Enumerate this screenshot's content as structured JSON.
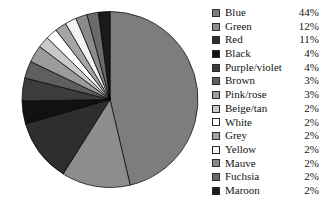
{
  "chart_data": {
    "type": "pie",
    "title": "",
    "start_angle_deg": 0,
    "direction": "clockwise",
    "legend_position": "right",
    "grid": false,
    "units": "percent",
    "categories": [
      "Blue",
      "Green",
      "Red",
      "Black",
      "Purple/violet",
      "Brown",
      "Pink/rose",
      "Beige/tan",
      "White",
      "Grey",
      "Yellow",
      "Mauve",
      "Fuchsia",
      "Maroon"
    ],
    "values": [
      44,
      12,
      11,
      4,
      4,
      3,
      3,
      2,
      2,
      2,
      2,
      2,
      2,
      2
    ],
    "labels": [
      "44%",
      "12%",
      "11%",
      "4%",
      "4%",
      "3%",
      "3%",
      "2%",
      "2%",
      "2%",
      "2%",
      "2%",
      "2%",
      "2%"
    ],
    "slice_colors": [
      "#7d7d7d",
      "#8d8d8d",
      "#2e2e2e",
      "#111111",
      "#3c3c3c",
      "#5f5f5f",
      "#9b9b9b",
      "#c9c9c9",
      "#ffffff",
      "#a5a5a5",
      "#f2f2f2",
      "#8a8a8a",
      "#6a6a6a",
      "#1a1a1a"
    ],
    "xlabel": "",
    "ylabel": ""
  },
  "legend": {
    "items": [
      {
        "label": "Blue",
        "pct": "44%",
        "swatch": "#7d7d7d"
      },
      {
        "label": "Green",
        "pct": "12%",
        "swatch": "#8d8d8d"
      },
      {
        "label": "Red",
        "pct": "11%",
        "swatch": "#2e2e2e"
      },
      {
        "label": "Black",
        "pct": "4%",
        "swatch": "#111111"
      },
      {
        "label": "Purple/violet",
        "pct": "4%",
        "swatch": "#3c3c3c"
      },
      {
        "label": "Brown",
        "pct": "3%",
        "swatch": "#5f5f5f"
      },
      {
        "label": "Pink/rose",
        "pct": "3%",
        "swatch": "#9b9b9b"
      },
      {
        "label": "Beige/tan",
        "pct": "2%",
        "swatch": "#c9c9c9"
      },
      {
        "label": "White",
        "pct": "2%",
        "swatch": "#ffffff"
      },
      {
        "label": "Grey",
        "pct": "2%",
        "swatch": "#a5a5a5"
      },
      {
        "label": "Yellow",
        "pct": "2%",
        "swatch": "#f2f2f2"
      },
      {
        "label": "Mauve",
        "pct": "2%",
        "swatch": "#8a8a8a"
      },
      {
        "label": "Fuchsia",
        "pct": "2%",
        "swatch": "#6a6a6a"
      },
      {
        "label": "Maroon",
        "pct": "2%",
        "swatch": "#1a1a1a"
      }
    ]
  },
  "pie_geometry": {
    "cx": 110,
    "cy": 99.5,
    "r": 88,
    "stroke": "#000000",
    "stroke_width": 0.7
  }
}
